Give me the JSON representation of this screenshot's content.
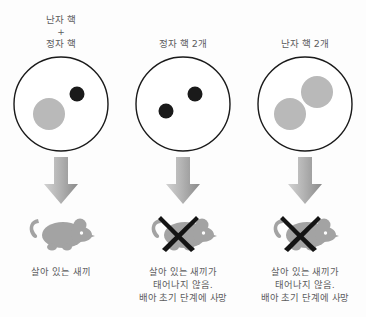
{
  "figure": {
    "background_color": "#fdfdfd",
    "text_color": "#5c5c5e",
    "nucleus_maternal_color": "#b9b9b9",
    "nucleus_paternal_color": "#1a1a1a",
    "cell_outline_color": "#1a1a1a",
    "mouse_color": "#a3a3a3",
    "cross_color": "#141414",
    "arrow_color_light": "#cccccc",
    "arrow_color_dark": "#8d8d8d"
  },
  "columns": [
    {
      "id": "maternal-plus-paternal",
      "header_lines": [
        "난자 핵",
        "+",
        "정자 핵"
      ],
      "nuclei": [
        {
          "type": "maternal",
          "label": "난자 핵",
          "color": "#b9b9b9",
          "cx": 38,
          "cy": 60,
          "r": 16
        },
        {
          "type": "paternal",
          "label": "정자 핵",
          "color": "#1a1a1a",
          "cx": 66,
          "cy": 40,
          "r": 7.5
        }
      ],
      "arrow": "down-arrow",
      "outcome_icon": "mouse",
      "crossed_out": false,
      "caption_lines": [
        "살아 있는 새끼"
      ]
    },
    {
      "id": "two-paternal",
      "header_lines": [
        "정자 핵 2개"
      ],
      "nuclei": [
        {
          "type": "paternal",
          "label": "정자 핵",
          "color": "#1a1a1a",
          "cx": 62,
          "cy": 40,
          "r": 7.5
        },
        {
          "type": "paternal",
          "label": "정자 핵",
          "color": "#1a1a1a",
          "cx": 33,
          "cy": 57,
          "r": 7.5
        }
      ],
      "arrow": "down-arrow",
      "outcome_icon": "mouse",
      "crossed_out": true,
      "caption_lines": [
        "살아 있는 새끼가",
        "태어나지 않음.",
        "배아 초기 단계에 사망"
      ]
    },
    {
      "id": "two-maternal",
      "header_lines": [
        "난자 핵 2개"
      ],
      "nuclei": [
        {
          "type": "maternal",
          "label": "난자 핵",
          "color": "#b9b9b9",
          "cx": 62,
          "cy": 38,
          "r": 16
        },
        {
          "type": "maternal",
          "label": "난자 핵",
          "color": "#b9b9b9",
          "cx": 35,
          "cy": 60,
          "r": 16
        }
      ],
      "arrow": "down-arrow",
      "outcome_icon": "mouse",
      "crossed_out": true,
      "caption_lines": [
        "살아 있는 새끼가",
        "태어나지 않음.",
        "배아 초기 단계에 사망"
      ]
    }
  ]
}
